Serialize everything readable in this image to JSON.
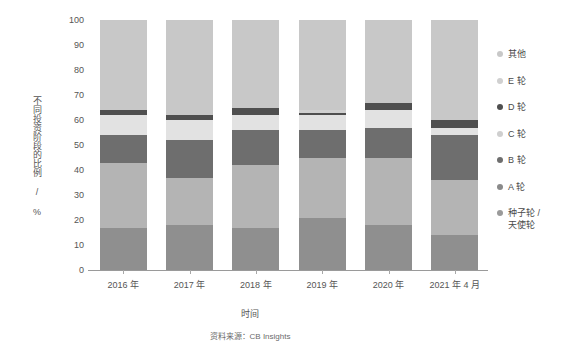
{
  "chart_data": {
    "type": "bar",
    "subtype": "stacked-percentage-column",
    "title": "",
    "xlabel": "时间",
    "ylabel": "不同投资阶段的比例 / %",
    "source_note": "资料来源：CB Insights",
    "categories": [
      "2016 年",
      "2017 年",
      "2018 年",
      "2019 年",
      "2020 年",
      "2021 年 4 月"
    ],
    "ylim": [
      0,
      100
    ],
    "yticks": [
      0,
      10,
      20,
      30,
      40,
      50,
      60,
      70,
      80,
      90,
      100
    ],
    "grid": false,
    "legend_position": "right",
    "stack_order_bottom_to_top": [
      "种子轮 /\n天使轮",
      "A 轮",
      "B 轮",
      "C 轮",
      "D 轮",
      "E 轮",
      "其他"
    ],
    "series": [
      {
        "name": "种子轮 /\n天使轮",
        "color": "#8f8f8f",
        "values": [
          17,
          18,
          17,
          21,
          18,
          14
        ]
      },
      {
        "name": "A 轮",
        "color": "#b4b4b4",
        "values": [
          26,
          19,
          25,
          24,
          27,
          22
        ]
      },
      {
        "name": "B 轮",
        "color": "#6e6e6e",
        "values": [
          11,
          15,
          14,
          11,
          12,
          18
        ]
      },
      {
        "name": "C 轮",
        "color": "#e2e2e2",
        "values": [
          8,
          8,
          6,
          6,
          7,
          3
        ]
      },
      {
        "name": "D 轮",
        "color": "#4f4f4f",
        "values": [
          2,
          2,
          3,
          1,
          3,
          3
        ]
      },
      {
        "name": "E 轮",
        "color": "#d0d0d0",
        "values": [
          0,
          0,
          0,
          1,
          0,
          0
        ]
      },
      {
        "name": "其他",
        "color": "#c8c8c8",
        "values": [
          36,
          38,
          35,
          36,
          33,
          40
        ]
      }
    ]
  },
  "legend": {
    "items": [
      {
        "label": "其他",
        "color": "#c8c8c8"
      },
      {
        "label": "E 轮",
        "color": "#d0d0d0"
      },
      {
        "label": "D 轮",
        "color": "#4f4f4f"
      },
      {
        "label": "C 轮",
        "color": "#cfcfcf"
      },
      {
        "label": "B 轮",
        "color": "#6e6e6e"
      },
      {
        "label": "A 轮",
        "color": "#8a8a8a"
      },
      {
        "label": "种子轮 /\n天使轮",
        "color": "#9a9a9a"
      }
    ]
  },
  "axis": {
    "y_title": "不同投资阶段的比例 / %",
    "x_title": "时间",
    "y_ticks": [
      "100",
      "90",
      "80",
      "70",
      "60",
      "50",
      "40",
      "30",
      "20",
      "10",
      "0"
    ]
  },
  "footer": {
    "source": "资料来源：CB Insights"
  }
}
